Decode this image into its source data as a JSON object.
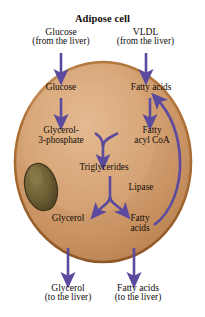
{
  "figure": {
    "title": "Adipose cell",
    "caption_partial": "",
    "colors": {
      "arrow": "#5b4a9e",
      "cell_fill_light": "#e2b48c",
      "cell_fill_mid": "#cd9a6d",
      "cell_fill_dark": "#b9824f",
      "cell_rim": "#a9building",
      "rim": "#a1662f",
      "nucleus_fill": "#6f6036",
      "nucleus_edge": "#4b3f21",
      "text": "#120d0a",
      "background": "#ffffff"
    }
  },
  "inputs": [
    {
      "name": "Glucose",
      "source": "(from the liver)"
    },
    {
      "name": "VLDL",
      "source": "(from the liver)"
    }
  ],
  "outputs": [
    {
      "name": "Glycerol",
      "destination": "(to the liver)"
    },
    {
      "name": "Fatty acids",
      "destination": "(to the liver)"
    }
  ],
  "cell_labels": {
    "glucose": "Glucose",
    "fatty_acids_top": "Fatty acids",
    "glycerol_3_phosphate_line1": "Glycerol-",
    "glycerol_3_phosphate_line2": "3-phosphate",
    "fatty_acyl_coa_line1": "Fatty",
    "fatty_acyl_coa_line2": "acyl CoA",
    "triglycerides": "Triglycerides",
    "lipase": "Lipase",
    "glycerol": "Glycerol",
    "fatty_acids_line1": "Fatty",
    "fatty_acids_line2": "acids"
  },
  "pathway": {
    "type": "metabolic-diagram",
    "steps": [
      "Glucose (from the liver) enters the adipose cell",
      "VLDL (from the liver) supplies fatty acids to the adipose cell",
      "Glucose is converted to Glycerol-3-phosphate",
      "Fatty acids are converted to Fatty acyl CoA",
      "Glycerol-3-phosphate and Fatty acyl CoA combine to form Triglycerides",
      "Lipase hydrolyzes Triglycerides into Glycerol and Fatty acids",
      "Fatty acids are recycled back toward Fatty acids at the cell top",
      "Glycerol exits to the liver",
      "Fatty acids exit to the liver"
    ]
  }
}
